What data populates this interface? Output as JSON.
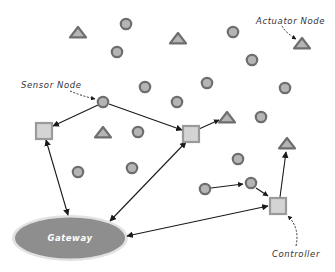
{
  "colors": {
    "node_stroke": "#6e6e6e",
    "node_fill": "#b5b5b5",
    "square_stroke": "#9a9a9a",
    "square_fill": "#d4d4d4",
    "gateway_fill": "#8e8e8e",
    "gateway_glow": "#dcdcdc",
    "arrow": "#1a1a1a"
  },
  "labels": {
    "sensor_node": "Sensor Node",
    "actuator_node": "Actuator Node",
    "controller": "Controller",
    "gateway": "Gateway"
  },
  "sensor_nodes": [
    {
      "x": 126,
      "y": 24
    },
    {
      "x": 117,
      "y": 52
    },
    {
      "x": 145,
      "y": 87
    },
    {
      "x": 103,
      "y": 102
    },
    {
      "x": 138,
      "y": 132
    },
    {
      "x": 233,
      "y": 32
    },
    {
      "x": 252,
      "y": 60
    },
    {
      "x": 207,
      "y": 83
    },
    {
      "x": 285,
      "y": 88
    },
    {
      "x": 177,
      "y": 102
    },
    {
      "x": 261,
      "y": 117
    },
    {
      "x": 78,
      "y": 172
    },
    {
      "x": 132,
      "y": 168
    },
    {
      "x": 238,
      "y": 159
    },
    {
      "x": 205,
      "y": 189
    },
    {
      "x": 251,
      "y": 183
    }
  ],
  "actuator_nodes": [
    {
      "x": 78,
      "y": 33
    },
    {
      "x": 178,
      "y": 39
    },
    {
      "x": 302,
      "y": 44
    },
    {
      "x": 103,
      "y": 133
    },
    {
      "x": 227,
      "y": 118
    },
    {
      "x": 287,
      "y": 144
    }
  ],
  "relay_squares": [
    {
      "name": "left-relay",
      "x": 44,
      "y": 131
    },
    {
      "name": "center-relay",
      "x": 191,
      "y": 134
    },
    {
      "name": "controller",
      "x": 278,
      "y": 206
    }
  ],
  "gateway": {
    "cx": 70,
    "cy": 238,
    "rx": 56,
    "ry": 21
  }
}
